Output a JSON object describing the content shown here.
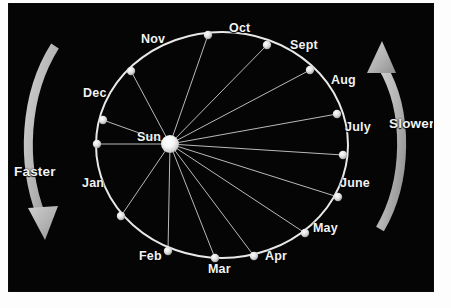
{
  "figure": {
    "background_color": "#050505",
    "panel": {
      "left": 8,
      "top": 3,
      "width": 426,
      "height": 289
    },
    "colors": {
      "background": "#050505",
      "orbit": "#e8e8e8",
      "radial_line": "#b9b9b9",
      "dot": "#e0e0e0",
      "sun": "#ffffff",
      "arrow": "#b0b0b0",
      "text": "#f2f2f2",
      "page": "#fdfdfd"
    }
  },
  "sun": {
    "label": "Sun",
    "cx": 170,
    "cy": 144,
    "radius": 9,
    "label_x": 137,
    "label_y": 131
  },
  "orbit": {
    "cx": 222,
    "cy": 145,
    "rx": 126,
    "ry": 113,
    "stroke_width": 2
  },
  "months": [
    {
      "label": "Nov",
      "dot_x": 208,
      "dot_y": 35,
      "label_x": 141,
      "label_y": 33
    },
    {
      "label": "Oct",
      "dot_x": 267,
      "dot_y": 45,
      "label_x": 229,
      "label_y": 22
    },
    {
      "label": "Sept",
      "dot_x": 310,
      "dot_y": 70,
      "label_x": 290,
      "label_y": 39
    },
    {
      "label": "Aug",
      "dot_x": 337,
      "dot_y": 114,
      "label_x": 331,
      "label_y": 74
    },
    {
      "label": "July",
      "dot_x": 343,
      "dot_y": 155,
      "label_x": 345,
      "label_y": 121
    },
    {
      "label": "June",
      "dot_x": 338,
      "dot_y": 197,
      "label_x": 340,
      "label_y": 177
    },
    {
      "label": "May",
      "dot_x": 305,
      "dot_y": 233,
      "label_x": 313,
      "label_y": 222
    },
    {
      "label": "Apr",
      "dot_x": 254,
      "dot_y": 256,
      "label_x": 265,
      "label_y": 250
    },
    {
      "label": "Mar",
      "dot_x": 215,
      "dot_y": 258,
      "label_x": 208,
      "label_y": 263
    },
    {
      "label": "Feb",
      "dot_x": 168,
      "dot_y": 251,
      "label_x": 139,
      "label_y": 250
    },
    {
      "label": "Jan",
      "dot_x": 121,
      "dot_y": 216,
      "label_x": 82,
      "label_y": 177
    },
    {
      "label": "Dec",
      "dot_x": 103,
      "dot_y": 120,
      "label_x": 83,
      "label_y": 87
    }
  ],
  "extra_dots": [
    {
      "dot_x": 97,
      "dot_y": 144
    },
    {
      "dot_x": 131,
      "dot_y": 71
    }
  ],
  "annotations": [
    {
      "label": "Faster",
      "label_x": 14,
      "label_y": 165,
      "arrow_name": "faster-arrow",
      "direction": "clockwise-down-left"
    },
    {
      "label": "Slower",
      "label_x": 389,
      "label_y": 117,
      "arrow_name": "slower-arrow",
      "direction": "counterclockwise-up-right"
    }
  ]
}
